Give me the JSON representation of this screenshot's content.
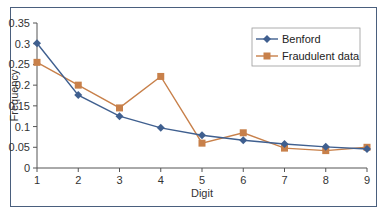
{
  "chart_data": {
    "type": "line",
    "title": "",
    "xlabel": "Digit",
    "ylabel": "Frequency",
    "x": [
      1,
      2,
      3,
      4,
      5,
      6,
      7,
      8,
      9
    ],
    "x_ticks": [
      "1",
      "2",
      "3",
      "4",
      "5",
      "6",
      "7",
      "8",
      "9"
    ],
    "y_ticks": [
      "0",
      "0.05",
      "0.1",
      "0.15",
      "0.2",
      "0.25",
      "0.3",
      "0.35"
    ],
    "ylim": [
      0,
      0.35
    ],
    "xlim": [
      1,
      9
    ],
    "grid": false,
    "legend_position": "top-right",
    "series": [
      {
        "name": "Benford",
        "color": "#3f5f8f",
        "marker": "diamond",
        "values": [
          0.301,
          0.176,
          0.125,
          0.097,
          0.079,
          0.067,
          0.058,
          0.051,
          0.046
        ]
      },
      {
        "name": "Fraudulent data",
        "color": "#c8804a",
        "marker": "square",
        "values": [
          0.255,
          0.2,
          0.145,
          0.221,
          0.06,
          0.085,
          0.048,
          0.042,
          0.05
        ]
      }
    ]
  }
}
